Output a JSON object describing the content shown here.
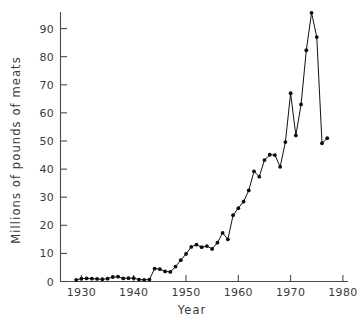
{
  "chart_data": {
    "type": "line",
    "title": "",
    "subtitle": "",
    "xlabel": "Year",
    "ylabel": "Millions of pounds of meats",
    "xlim": [
      1926,
      1981
    ],
    "ylim": [
      0,
      99
    ],
    "xticks": [
      1930,
      1940,
      1950,
      1960,
      1970,
      1980
    ],
    "xticklabels": [
      "1930",
      "1940",
      "1950",
      "1960",
      "1970",
      "1980"
    ],
    "yticks": [
      0,
      10,
      20,
      30,
      40,
      50,
      60,
      70,
      80,
      90
    ],
    "yticklabels": [
      "0",
      "10",
      "20",
      "30",
      "40",
      "50",
      "60",
      "70",
      "80",
      "90"
    ],
    "grid": false,
    "legend": false,
    "legend_position": "none",
    "marker": "filled-circle",
    "line_color": "#111111",
    "marker_color": "#0d0d0d",
    "series": [
      {
        "name": "Millions of pounds of meats",
        "x": [
          1929,
          1930,
          1931,
          1932,
          1933,
          1934,
          1935,
          1936,
          1937,
          1938,
          1939,
          1940,
          1941,
          1942,
          1943,
          1944,
          1945,
          1946,
          1947,
          1948,
          1949,
          1950,
          1951,
          1952,
          1953,
          1954,
          1955,
          1956,
          1957,
          1958,
          1959,
          1960,
          1961,
          1962,
          1963,
          1964,
          1965,
          1966,
          1967,
          1968,
          1969,
          1970,
          1971,
          1972,
          1973,
          1974,
          1975,
          1976,
          1977
        ],
        "y": [
          0.6,
          1.0,
          1.1,
          1.0,
          0.9,
          0.8,
          1.0,
          1.6,
          1.7,
          1.1,
          1.2,
          1.2,
          0.7,
          0.6,
          0.7,
          4.6,
          4.4,
          3.6,
          3.4,
          5.3,
          7.6,
          9.8,
          12.3,
          13.1,
          12.2,
          12.6,
          11.6,
          13.8,
          17.3,
          15.0,
          23.6,
          26.1,
          28.4,
          32.4,
          39.2,
          37.3,
          43.2,
          45.1,
          45.0,
          40.8,
          49.6,
          67.0,
          52.0,
          63.0,
          82.3,
          95.6,
          87.0,
          49.2,
          51.0
        ]
      }
    ]
  },
  "axes": {
    "ylabel_text": "Millions of pounds of meats",
    "xlabel_text": "Year"
  }
}
